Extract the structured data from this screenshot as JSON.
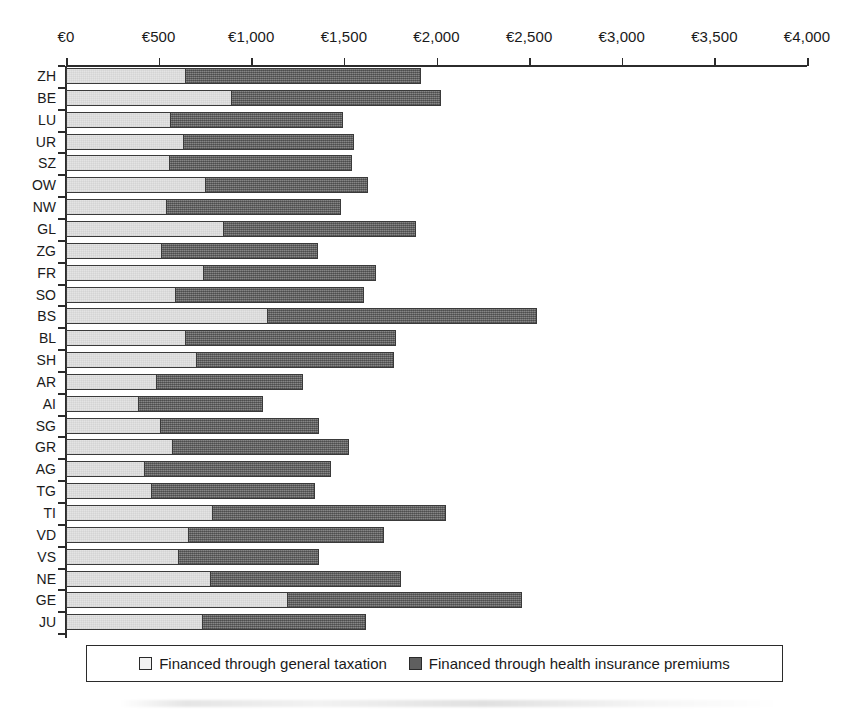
{
  "chart_data": {
    "type": "bar",
    "orientation": "horizontal",
    "stacked": true,
    "title": "",
    "subtitle": "",
    "xlabel": "",
    "ylabel": "",
    "xlim": [
      0,
      4000
    ],
    "grid": false,
    "legend_position": "bottom",
    "x_tick_labels": [
      "€0",
      "€500",
      "€1,000",
      "€1,500",
      "€2,000",
      "€2,500",
      "€3,000",
      "€3,500",
      "€4,000"
    ],
    "x_tick_values": [
      0,
      500,
      1000,
      1500,
      2000,
      2500,
      3000,
      3500,
      4000
    ],
    "categories": [
      "ZH",
      "BE",
      "LU",
      "UR",
      "SZ",
      "OW",
      "NW",
      "GL",
      "ZG",
      "FR",
      "SO",
      "BS",
      "BL",
      "SH",
      "AR",
      "AI",
      "SG",
      "GR",
      "AG",
      "TG",
      "TI",
      "VD",
      "VS",
      "NE",
      "GE",
      "JU"
    ],
    "series": [
      {
        "name": "Financed through general taxation",
        "color": "#e4e4e4",
        "values": [
          640,
          890,
          560,
          630,
          555,
          750,
          540,
          845,
          515,
          740,
          590,
          1085,
          640,
          700,
          485,
          390,
          510,
          570,
          420,
          460,
          790,
          660,
          605,
          775,
          1195,
          735
        ]
      },
      {
        "name": "Financed through health insurance premiums",
        "color": "#6f6f6f",
        "values": [
          1270,
          1130,
          930,
          920,
          985,
          875,
          940,
          1040,
          840,
          930,
          1015,
          1450,
          1135,
          1065,
          790,
          670,
          850,
          950,
          1005,
          880,
          1255,
          1050,
          755,
          1030,
          1260,
          880
        ]
      }
    ],
    "totals": [
      1910,
      2020,
      1490,
      1550,
      1540,
      1625,
      1480,
      1885,
      1355,
      1670,
      1605,
      2535,
      1775,
      1765,
      1275,
      1060,
      1360,
      1520,
      1425,
      1340,
      2045,
      1710,
      1360,
      1805,
      2455,
      1615
    ]
  },
  "legend": {
    "entries": [
      {
        "label": "Financed through general taxation",
        "swatch": "light-swatch-icon"
      },
      {
        "label": "Financed through health insurance premiums",
        "swatch": "dark-swatch-icon"
      }
    ]
  },
  "colors": {
    "light_fill": "#e4e4e4",
    "dark_fill": "#6f6f6f",
    "outline": "#3a3a3a",
    "axis": "#2b2b2b",
    "background": "#ffffff",
    "text": "#1a1a1a"
  },
  "geometry": {
    "axis_x0": 66,
    "axis_x1": 807,
    "axis_y": 65,
    "bars_top": 68,
    "row_pitch": 21.85,
    "bar_height": 16,
    "legend": {
      "left": 86,
      "top": 645,
      "width": 697,
      "height": 37
    }
  }
}
